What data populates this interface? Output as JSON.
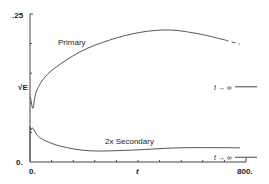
{
  "chart_data": {
    "type": "line",
    "title": "",
    "xlabel": "t",
    "ylabel": "√E",
    "xlim": [
      0,
      800
    ],
    "ylim": [
      0,
      0.25
    ],
    "x_tick_labels": [
      "0.",
      "t",
      "800."
    ],
    "y_tick_labels": [
      ".25",
      "√E",
      "0."
    ],
    "grid": false,
    "legend": "inline labels",
    "series": [
      {
        "name": "Primary",
        "x": [
          4,
          11,
          26,
          74,
          185,
          296,
          407,
          519,
          630,
          722,
          778
        ],
        "y": [
          0.105,
          0.091,
          0.122,
          0.152,
          0.186,
          0.206,
          0.219,
          0.223,
          0.216,
          0.206,
          0.199
        ],
        "asymptote_label": "t → ∞",
        "asymptote_y": 0.127,
        "dashed_tail": true
      },
      {
        "name": "2x Secondary",
        "x": [
          4,
          11,
          37,
          111,
          222,
          370,
          556,
          778
        ],
        "y": [
          0.054,
          0.057,
          0.041,
          0.027,
          0.019,
          0.02,
          0.024,
          0.024
        ],
        "asymptote_label": "t → ∞",
        "asymptote_y": 0.008
      }
    ],
    "annotations": [
      {
        "text": "Primary",
        "near_series": "Primary"
      },
      {
        "text": "2x Secondary",
        "near_series": "2x Secondary"
      },
      {
        "text": "t → ∞",
        "near_series": "Primary"
      },
      {
        "text": "t → ∞",
        "near_series": "2x Secondary"
      }
    ]
  },
  "labels": {
    "y_top": ".25",
    "y_mid": "√E",
    "y_bottom": "0.",
    "x_left": "0.",
    "x_mid": "t",
    "x_right": "800.",
    "primary": "Primary",
    "secondary": "2x Secondary",
    "asym_primary": "t → ∞",
    "asym_secondary": "t → ∞"
  },
  "colors": {
    "line": "#555555",
    "axis": "#444444",
    "text": "#222222"
  }
}
